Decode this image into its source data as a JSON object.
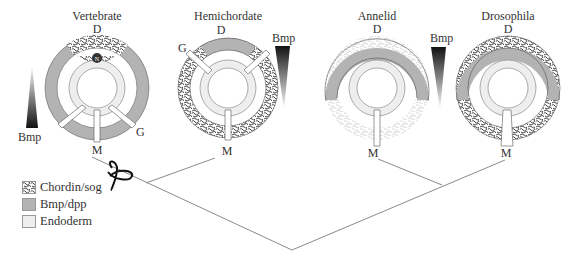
{
  "colors": {
    "bmp_dpp": "#b3b3b3",
    "endoderm": "#eeeeee",
    "chordin_bg": "#ffffff",
    "chordin_fg": "#333333",
    "outline": "#555555",
    "tree_line": "#8a8a8a",
    "text": "#333333"
  },
  "organisms": [
    {
      "name": "Vertebrate",
      "dorsal_label": "D",
      "ventral_label": "M",
      "gut_label": "G",
      "notochord_label": "N"
    },
    {
      "name": "Hemichordate",
      "dorsal_label": "D",
      "ventral_label": "M",
      "gut_label": "G"
    },
    {
      "name": "Annelid",
      "dorsal_label": "D",
      "ventral_label": "M"
    },
    {
      "name": "Drosophila",
      "dorsal_label": "D",
      "ventral_label": "M"
    }
  ],
  "gradients": [
    {
      "label": "Bmp",
      "position": "vertebrate-left",
      "direction": "dark-bottom"
    },
    {
      "label": "Bmp",
      "position": "hemichordate-right",
      "direction": "dark-top"
    },
    {
      "label": "Bmp",
      "position": "annelid-right",
      "direction": "dark-top"
    }
  ],
  "inversion_symbol": "loop",
  "legend": [
    {
      "label": "Chordin/sog",
      "pattern": "chordin"
    },
    {
      "label": "Bmp/dpp",
      "pattern": "bmp"
    },
    {
      "label": "Endoderm",
      "pattern": "endoderm"
    }
  ]
}
